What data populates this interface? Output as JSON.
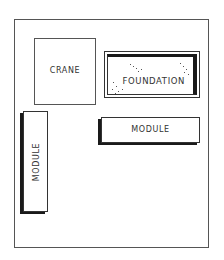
{
  "diagram": {
    "type": "site-layout",
    "frame": "site boundary",
    "blocks": [
      {
        "id": "crane",
        "label": "CRANE",
        "style": "plain"
      },
      {
        "id": "foundation",
        "label": "FOUNDATION",
        "style": "stippled, heavy double border"
      },
      {
        "id": "module_horizontal",
        "label": "MODULE",
        "style": "3D shadowed, horizontal"
      },
      {
        "id": "module_vertical",
        "label": "MODULE",
        "style": "3D shadowed, vertical rotated text"
      }
    ]
  }
}
